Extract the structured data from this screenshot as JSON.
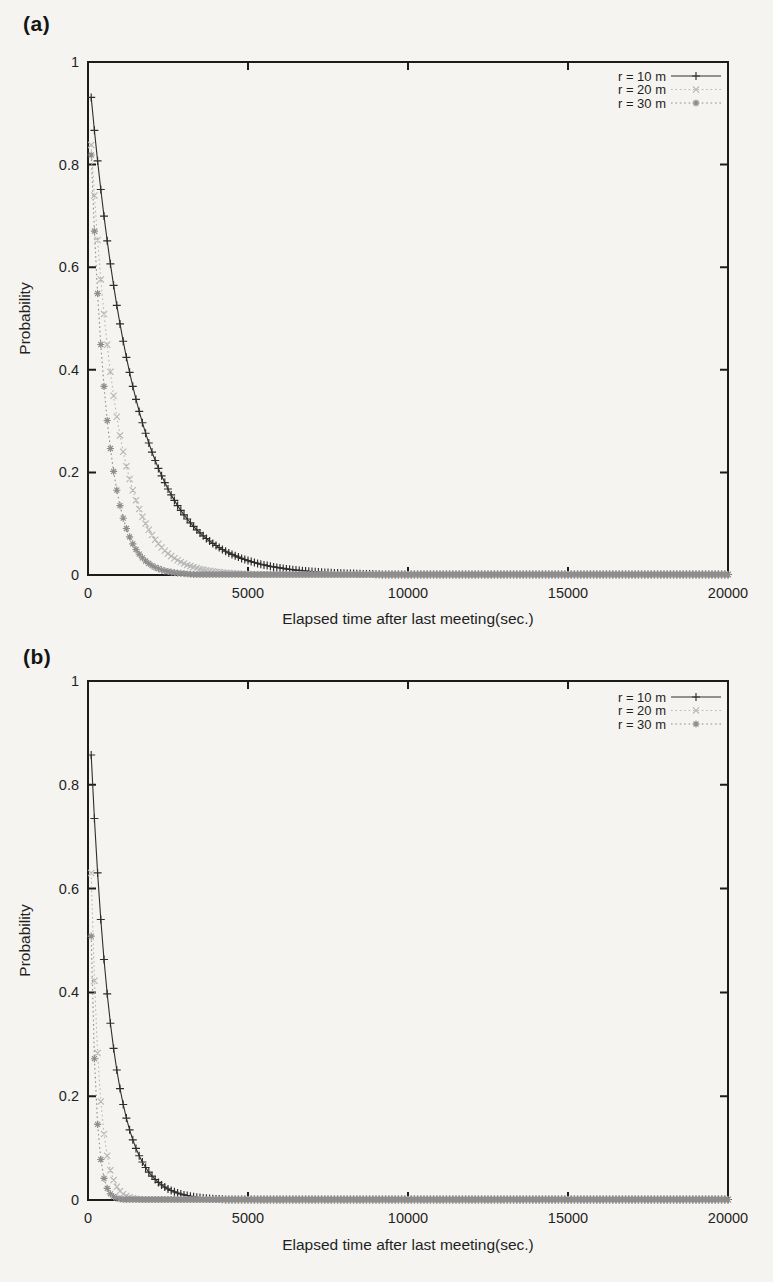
{
  "figure": {
    "background_color": "#f5f4f1",
    "frame_color": "#1c1c1c",
    "text_color": "#1f1f1f"
  },
  "chart_data": [
    {
      "type": "line",
      "panel_label": "(a)",
      "xlabel": "Elapsed time after last meeting(sec.)",
      "ylabel": "Probability",
      "xlim": [
        0,
        20000
      ],
      "ylim": [
        0,
        1
      ],
      "xticks": [
        0,
        5000,
        10000,
        15000,
        20000
      ],
      "yticks": [
        0,
        0.2,
        0.4,
        0.6,
        0.8,
        1
      ],
      "grid": false,
      "legend_position": "top-right-inside",
      "series": [
        {
          "name": "r = 10 m",
          "marker": "plus",
          "line_style": "solid",
          "color": "#2e2e2e",
          "decay_model": {
            "amplitude": 1.0,
            "tau": 1400,
            "t_start": 100,
            "t_end": 20000,
            "t_step": 100
          },
          "anchor_points": [
            [
              100,
              0.94
            ],
            [
              500,
              0.7
            ],
            [
              1000,
              0.49
            ],
            [
              2400,
              0.18
            ],
            [
              5000,
              0.03
            ],
            [
              8000,
              0.0
            ],
            [
              20000,
              0.0
            ]
          ]
        },
        {
          "name": "r = 20 m",
          "marker": "cross",
          "line_style": "dotted",
          "color": "#b7b7b7",
          "decay_model": {
            "amplitude": 0.95,
            "tau": 800,
            "t_start": 100,
            "t_end": 20000,
            "t_step": 100
          },
          "anchor_points": [
            [
              100,
              0.84
            ],
            [
              600,
              0.45
            ],
            [
              1250,
              0.2
            ],
            [
              3000,
              0.02
            ],
            [
              5000,
              0.0
            ],
            [
              20000,
              0.0
            ]
          ]
        },
        {
          "name": "r = 30 m",
          "marker": "asterisk",
          "line_style": "dotted",
          "color": "#8e8e8e",
          "decay_model": {
            "amplitude": 1.0,
            "tau": 500,
            "t_start": 100,
            "t_end": 20000,
            "t_step": 100
          },
          "anchor_points": [
            [
              100,
              0.82
            ],
            [
              500,
              0.37
            ],
            [
              800,
              0.2
            ],
            [
              2000,
              0.02
            ],
            [
              4000,
              0.0
            ],
            [
              20000,
              0.0
            ]
          ]
        }
      ]
    },
    {
      "type": "line",
      "panel_label": "(b)",
      "xlabel": "Elapsed time after last meeting(sec.)",
      "ylabel": "Probability",
      "xlim": [
        0,
        20000
      ],
      "ylim": [
        0,
        1
      ],
      "xticks": [
        0,
        5000,
        10000,
        15000,
        20000
      ],
      "yticks": [
        0,
        0.2,
        0.4,
        0.6,
        0.8,
        1
      ],
      "grid": false,
      "legend_position": "top-right-inside",
      "series": [
        {
          "name": "r = 10 m",
          "marker": "plus",
          "line_style": "solid",
          "color": "#2e2e2e",
          "decay_model": {
            "amplitude": 1.0,
            "tau": 650,
            "t_start": 100,
            "t_end": 20000,
            "t_step": 100
          },
          "anchor_points": [
            [
              100,
              0.88
            ],
            [
              300,
              0.63
            ],
            [
              500,
              0.46
            ],
            [
              1050,
              0.2
            ],
            [
              2500,
              0.02
            ],
            [
              20000,
              0.0
            ]
          ]
        },
        {
          "name": "r = 20 m",
          "marker": "cross",
          "line_style": "dotted",
          "color": "#b7b7b7",
          "decay_model": {
            "amplitude": 0.94,
            "tau": 250,
            "t_start": 100,
            "t_end": 20000,
            "t_step": 100
          },
          "anchor_points": [
            [
              100,
              0.63
            ],
            [
              300,
              0.28
            ],
            [
              400,
              0.2
            ],
            [
              800,
              0.04
            ],
            [
              20000,
              0.0
            ]
          ]
        },
        {
          "name": "r = 30 m",
          "marker": "asterisk",
          "line_style": "dotted",
          "color": "#8e8e8e",
          "decay_model": {
            "amplitude": 0.95,
            "tau": 160,
            "t_start": 100,
            "t_end": 20000,
            "t_step": 100
          },
          "anchor_points": [
            [
              100,
              0.51
            ],
            [
              200,
              0.27
            ],
            [
              300,
              0.15
            ],
            [
              500,
              0.04
            ],
            [
              20000,
              0.0
            ]
          ]
        }
      ]
    }
  ]
}
